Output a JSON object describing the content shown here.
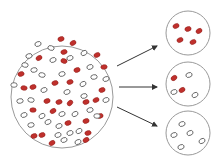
{
  "diagram": {
    "type": "sampling-illustration",
    "colors": {
      "background": "#ffffff",
      "circle_stroke": "#9a9a9a",
      "red_cell_fill": "#c0302c",
      "red_cell_stroke": "#8e1f1c",
      "white_cell_fill": "#ffffff",
      "white_cell_stroke": "#555555",
      "arrow": "#333333"
    },
    "population": {
      "label": "population",
      "cx": 62,
      "cy": 97,
      "r": 51,
      "cells": [
        {
          "x": 61,
          "y": 39,
          "c": "red",
          "a": -20
        },
        {
          "x": 73,
          "y": 43,
          "c": "red",
          "a": -30
        },
        {
          "x": 38,
          "y": 44,
          "c": "white",
          "a": -20
        },
        {
          "x": 51,
          "y": 48,
          "c": "white",
          "a": 15
        },
        {
          "x": 64,
          "y": 52,
          "c": "red",
          "a": -15
        },
        {
          "x": 84,
          "y": 53,
          "c": "white",
          "a": -30
        },
        {
          "x": 29,
          "y": 56,
          "c": "white",
          "a": -15
        },
        {
          "x": 39,
          "y": 58,
          "c": "red",
          "a": -30
        },
        {
          "x": 53,
          "y": 60,
          "c": "white",
          "a": -20
        },
        {
          "x": 64,
          "y": 61,
          "c": "red",
          "a": 20
        },
        {
          "x": 70,
          "y": 58,
          "c": "white",
          "a": -20
        },
        {
          "x": 97,
          "y": 55,
          "c": "red",
          "a": -25
        },
        {
          "x": 25,
          "y": 65,
          "c": "white",
          "a": 10
        },
        {
          "x": 34,
          "y": 70,
          "c": "white",
          "a": -10
        },
        {
          "x": 42,
          "y": 75,
          "c": "white",
          "a": 10
        },
        {
          "x": 77,
          "y": 70,
          "c": "red",
          "a": -20
        },
        {
          "x": 90,
          "y": 67,
          "c": "white",
          "a": -20
        },
        {
          "x": 104,
          "y": 67,
          "c": "red",
          "a": -10
        },
        {
          "x": 21,
          "y": 74,
          "c": "red",
          "a": -15
        },
        {
          "x": 62,
          "y": 74,
          "c": "white",
          "a": -15
        },
        {
          "x": 94,
          "y": 77,
          "c": "white",
          "a": -10
        },
        {
          "x": 106,
          "y": 79,
          "c": "white",
          "a": -20
        },
        {
          "x": 55,
          "y": 83,
          "c": "red",
          "a": -15
        },
        {
          "x": 70,
          "y": 82,
          "c": "red",
          "a": -15
        },
        {
          "x": 83,
          "y": 84,
          "c": "white",
          "a": -30
        },
        {
          "x": 14,
          "y": 85,
          "c": "white",
          "a": 0
        },
        {
          "x": 24,
          "y": 88,
          "c": "red",
          "a": 10
        },
        {
          "x": 33,
          "y": 87,
          "c": "red",
          "a": -20
        },
        {
          "x": 44,
          "y": 90,
          "c": "white",
          "a": -20
        },
        {
          "x": 67,
          "y": 92,
          "c": "white",
          "a": -20
        },
        {
          "x": 84,
          "y": 96,
          "c": "white",
          "a": -15
        },
        {
          "x": 102,
          "y": 90,
          "c": "red",
          "a": -20
        },
        {
          "x": 20,
          "y": 101,
          "c": "white",
          "a": -10
        },
        {
          "x": 31,
          "y": 100,
          "c": "white",
          "a": 10
        },
        {
          "x": 47,
          "y": 101,
          "c": "red",
          "a": -20
        },
        {
          "x": 59,
          "y": 102,
          "c": "red",
          "a": -15
        },
        {
          "x": 70,
          "y": 103,
          "c": "red",
          "a": -45
        },
        {
          "x": 86,
          "y": 102,
          "c": "red",
          "a": -20
        },
        {
          "x": 96,
          "y": 100,
          "c": "red",
          "a": -25
        },
        {
          "x": 106,
          "y": 100,
          "c": "white",
          "a": -20
        },
        {
          "x": 33,
          "y": 110,
          "c": "red",
          "a": 0
        },
        {
          "x": 53,
          "y": 111,
          "c": "red",
          "a": -30
        },
        {
          "x": 24,
          "y": 115,
          "c": "white",
          "a": -20
        },
        {
          "x": 42,
          "y": 116,
          "c": "white",
          "a": -30
        },
        {
          "x": 62,
          "y": 114,
          "c": "white",
          "a": -20
        },
        {
          "x": 75,
          "y": 114,
          "c": "white",
          "a": -30
        },
        {
          "x": 90,
          "y": 110,
          "c": "white",
          "a": -15
        },
        {
          "x": 100,
          "y": 116,
          "c": "red",
          "a": -20
        },
        {
          "x": 31,
          "y": 125,
          "c": "white",
          "a": -10
        },
        {
          "x": 48,
          "y": 122,
          "c": "white",
          "a": -25
        },
        {
          "x": 59,
          "y": 126,
          "c": "white",
          "a": -20
        },
        {
          "x": 68,
          "y": 123,
          "c": "red",
          "a": -20
        },
        {
          "x": 86,
          "y": 121,
          "c": "red",
          "a": -20
        },
        {
          "x": 97,
          "y": 116,
          "c": "white",
          "a": 0
        },
        {
          "x": 34,
          "y": 136,
          "c": "red",
          "a": -20
        },
        {
          "x": 42,
          "y": 135,
          "c": "red",
          "a": -20
        },
        {
          "x": 58,
          "y": 135,
          "c": "white",
          "a": -20
        },
        {
          "x": 70,
          "y": 133,
          "c": "white",
          "a": -20
        },
        {
          "x": 79,
          "y": 131,
          "c": "white",
          "a": -30
        },
        {
          "x": 88,
          "y": 133,
          "c": "red",
          "a": -15
        },
        {
          "x": 52,
          "y": 143,
          "c": "red",
          "a": -30
        },
        {
          "x": 64,
          "y": 140,
          "c": "white",
          "a": -20
        },
        {
          "x": 78,
          "y": 142,
          "c": "white",
          "a": -25
        },
        {
          "x": 86,
          "y": 140,
          "c": "red",
          "a": -30
        }
      ]
    },
    "arrows": [
      {
        "x1": 117,
        "y1": 66,
        "x2": 157,
        "y2": 46
      },
      {
        "x1": 119,
        "y1": 87,
        "x2": 157,
        "y2": 87
      },
      {
        "x1": 117,
        "y1": 107,
        "x2": 157,
        "y2": 126
      }
    ],
    "samples": [
      {
        "label": "sample-1-all-red",
        "cx": 188,
        "cy": 33,
        "r": 22,
        "cells": [
          {
            "x": 176,
            "y": 26,
            "c": "red",
            "a": -25
          },
          {
            "x": 188,
            "y": 29,
            "c": "red",
            "a": -20
          },
          {
            "x": 199,
            "y": 31,
            "c": "red",
            "a": -30
          },
          {
            "x": 180,
            "y": 40,
            "c": "red",
            "a": -25
          },
          {
            "x": 193,
            "y": 42,
            "c": "red",
            "a": -25
          }
        ]
      },
      {
        "label": "sample-2-mixed",
        "cx": 188,
        "cy": 84,
        "r": 22,
        "cells": [
          {
            "x": 174,
            "y": 78,
            "c": "red",
            "a": -35
          },
          {
            "x": 189,
            "y": 75,
            "c": "white",
            "a": -20
          },
          {
            "x": 182,
            "y": 90,
            "c": "red",
            "a": -30
          },
          {
            "x": 174,
            "y": 92,
            "c": "white",
            "a": -20
          },
          {
            "x": 195,
            "y": 95,
            "c": "white",
            "a": -30
          }
        ]
      },
      {
        "label": "sample-3-all-white",
        "cx": 188,
        "cy": 133,
        "r": 22,
        "cells": [
          {
            "x": 182,
            "y": 124,
            "c": "white",
            "a": -20
          },
          {
            "x": 190,
            "y": 133,
            "c": "white",
            "a": -25
          },
          {
            "x": 174,
            "y": 135,
            "c": "white",
            "a": -20
          },
          {
            "x": 202,
            "y": 141,
            "c": "white",
            "a": -30
          },
          {
            "x": 181,
            "y": 147,
            "c": "white",
            "a": -20
          }
        ]
      }
    ]
  }
}
